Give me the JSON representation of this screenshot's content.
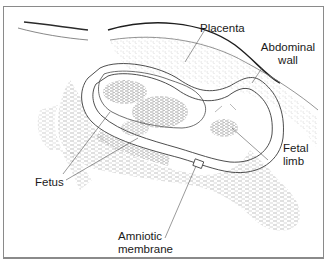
{
  "diagram": {
    "type": "anatomical-ultrasound-illustration",
    "labels": [
      {
        "id": "placenta",
        "text": "Placenta"
      },
      {
        "id": "abdominal_wall",
        "text": "Abdominal wall",
        "lines": [
          "Abdominal",
          "wall"
        ]
      },
      {
        "id": "fetal_limb",
        "text": "Fetal limb",
        "lines": [
          "Fetal",
          "limb"
        ]
      },
      {
        "id": "fetus",
        "text": "Fetus"
      },
      {
        "id": "amniotic_membrane",
        "text": "Amniotic membrane",
        "lines": [
          "Amniotic",
          "membrane"
        ]
      }
    ],
    "colors": {
      "line": "#2a2a2a",
      "stipple": "#9a9a9a",
      "frame": "#8a8a8a",
      "background": "#ffffff"
    }
  }
}
